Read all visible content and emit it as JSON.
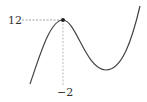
{
  "diagram": {
    "type": "function-graph",
    "labels": {
      "y_value": "12",
      "x_value": "−2"
    },
    "marked_point": {
      "x": -2,
      "y": 12
    },
    "colors": {
      "curve": "#444444",
      "guide": "#888888",
      "point": "#222222",
      "text": "#333333"
    }
  }
}
